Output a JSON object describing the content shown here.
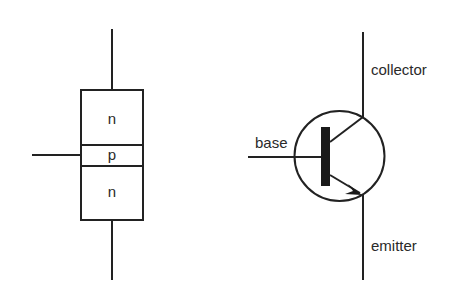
{
  "diagram": {
    "structure": {
      "regions": [
        {
          "id": "top",
          "label": "n"
        },
        {
          "id": "middle",
          "label": "p"
        },
        {
          "id": "bottom",
          "label": "n"
        }
      ]
    },
    "symbol": {
      "terminals": {
        "base": "base",
        "collector": "collector",
        "emitter": "emitter"
      }
    },
    "colors": {
      "stroke": "#222222",
      "background": "#ffffff"
    }
  }
}
